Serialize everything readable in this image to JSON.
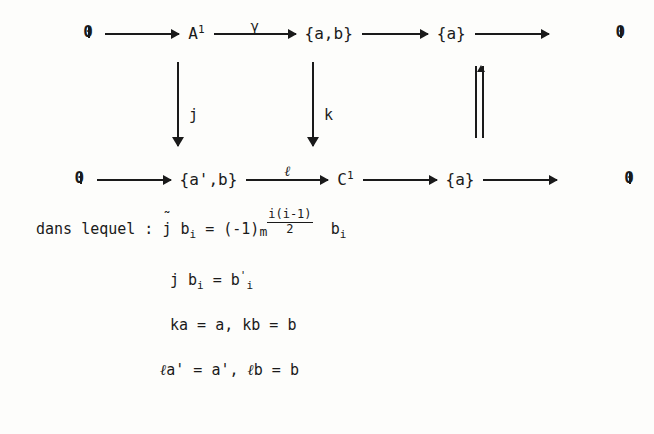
{
  "document": {
    "type": "commutative-diagram-with-equations",
    "language": "fr"
  },
  "diagram": {
    "row1": {
      "nodes": [
        {
          "id": "n1",
          "text": "0",
          "glyph": "zero-object"
        },
        {
          "id": "n2",
          "base": "A",
          "sup": "1",
          "text": "A1"
        },
        {
          "id": "n3",
          "text": "{a,b}"
        },
        {
          "id": "n4",
          "text": "{a}"
        },
        {
          "id": "n5",
          "text": "0",
          "glyph": "zero-object"
        }
      ],
      "arrows": [
        {
          "id": "a1",
          "label": ""
        },
        {
          "id": "a2",
          "label": "γ"
        },
        {
          "id": "a3",
          "label": ""
        },
        {
          "id": "a4",
          "label": ""
        }
      ]
    },
    "row2": {
      "nodes": [
        {
          "id": "m1",
          "text": "0",
          "glyph": "zero-object"
        },
        {
          "id": "m2",
          "text": "{a',b}"
        },
        {
          "id": "m3",
          "base": "C",
          "sup": "1",
          "text": "C1"
        },
        {
          "id": "m4",
          "text": "{a}"
        },
        {
          "id": "m5",
          "text": "0",
          "glyph": "zero-object"
        }
      ],
      "arrows": [
        {
          "id": "b1",
          "label": ""
        },
        {
          "id": "b2",
          "label": "ℓ"
        },
        {
          "id": "b3",
          "label": ""
        },
        {
          "id": "b4",
          "label": ""
        }
      ]
    },
    "verticals": [
      {
        "id": "v1",
        "label": "j",
        "kind": "down-arrow"
      },
      {
        "id": "v2",
        "label": "k",
        "kind": "down-arrow"
      },
      {
        "id": "v3",
        "label": "",
        "kind": "double-bar"
      }
    ]
  },
  "text": {
    "intro": "dans lequel : ",
    "line1": {
      "lhs_symbol": "j",
      "lhs_accent": "˜",
      "lhs_sub": "i",
      "lhs_var": "b",
      "eq": "=",
      "rhs_base": "(-1)",
      "exp_m": "m",
      "exp_num": "i(i-1)",
      "exp_den": "2",
      "rhs_var": "b",
      "rhs_sub": "i"
    },
    "line2": "j b",
    "line2_sub": "i",
    "line2_eq": "= b",
    "line2_prime_sub": "i",
    "line2_prime": "'",
    "line3": "ka = a, kb = b",
    "line4_ell": "ℓ",
    "line4_a": "a' = a', ",
    "line4_ell2": "ℓ",
    "line4_b": "b = b"
  },
  "colors": {
    "ink": "#1a1a1a",
    "paper": "#fdfdfb"
  }
}
